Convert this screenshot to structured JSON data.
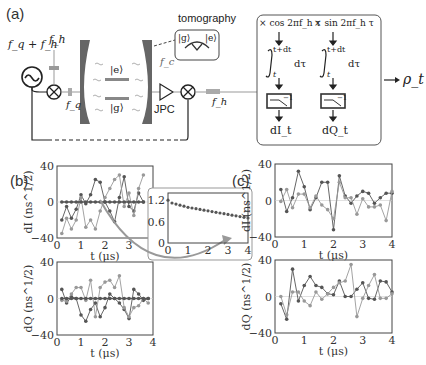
{
  "figure": {
    "panel_labels": {
      "a": "(a)",
      "b": "(b)",
      "c": "(c)"
    },
    "diagram": {
      "source_label": "f_q + f_h",
      "pump_label": "f_h",
      "drive_label": "f_q",
      "state_e": "|e⟩",
      "state_g": "|g⟩",
      "cavity_label": "f_c",
      "amplifier_label": "JPC",
      "output_label": "f_h",
      "tomography_label": "tomography",
      "tomography_states": {
        "g": "|g⟩",
        "e": "|e⟩"
      },
      "demod": {
        "cos_label": "× cos 2πf_h τ",
        "sin_label": "× sin 2πf_h τ",
        "integral_upper": "t+dt",
        "integral_lower": "t",
        "integral_var": "dτ",
        "output_I": "dI_t",
        "output_Q": "dQ_t",
        "filter_label": "−1",
        "result": "ρ_t"
      }
    }
  },
  "chart_data": [
    {
      "id": "b-top",
      "type": "line",
      "panel": "(b)",
      "xlabel": "t (μs)",
      "ylabel": "dI (ns^1/2)",
      "xlim": [
        0,
        4
      ],
      "ylim": [
        -40,
        40
      ],
      "xticks": [
        0,
        1,
        2,
        3,
        4
      ],
      "yticks": [
        -40,
        0,
        40
      ],
      "x": [
        0.2,
        0.4,
        0.6,
        0.8,
        1.0,
        1.2,
        1.4,
        1.6,
        1.8,
        2.0,
        2.2,
        2.4,
        2.6,
        2.8,
        3.0,
        3.2,
        3.4,
        3.6
      ],
      "series": [
        {
          "name": "dark",
          "values": [
            -20,
            -5,
            -18,
            -8,
            8,
            -2,
            8,
            25,
            22,
            0,
            -10,
            -22,
            5,
            28,
            -5,
            -10,
            10,
            0
          ]
        },
        {
          "name": "light",
          "values": [
            -35,
            -18,
            -30,
            -20,
            5,
            -28,
            -20,
            -30,
            -10,
            5,
            15,
            25,
            30,
            -5,
            10,
            -15,
            15,
            30
          ]
        },
        {
          "name": "zero",
          "values": [
            0,
            0,
            0,
            0,
            0,
            0,
            0,
            0,
            0,
            0,
            0,
            0,
            0,
            0,
            0,
            0,
            0,
            0
          ]
        }
      ]
    },
    {
      "id": "b-inset",
      "type": "scatter",
      "xlim": [
        0,
        4
      ],
      "ylim": [
        0,
        1.4
      ],
      "xticks": [
        0,
        1,
        2,
        3,
        4
      ],
      "yticks": [
        0,
        0.6,
        1.2
      ],
      "x": [
        0.0,
        0.2,
        0.4,
        0.6,
        0.8,
        1.0,
        1.2,
        1.4,
        1.6,
        1.8,
        2.0,
        2.2,
        2.4,
        2.6,
        2.8,
        3.0,
        3.2,
        3.4,
        3.6,
        3.8,
        4.0
      ],
      "values": [
        1.2,
        1.12,
        1.09,
        1.06,
        1.03,
        1.0,
        0.98,
        0.96,
        0.94,
        0.92,
        0.9,
        0.88,
        0.86,
        0.84,
        0.82,
        0.8,
        0.78,
        0.76,
        0.74,
        0.72,
        0.7
      ]
    },
    {
      "id": "b-bottom",
      "type": "line",
      "panel": "(b)",
      "xlabel": "t (μs)",
      "ylabel": "dQ (ns^1/2)",
      "xlim": [
        0,
        4
      ],
      "ylim": [
        -40,
        40
      ],
      "xticks": [
        0,
        1,
        2,
        3,
        4
      ],
      "yticks": [
        -40,
        0,
        40
      ],
      "x": [
        0.2,
        0.4,
        0.6,
        0.8,
        1.0,
        1.2,
        1.4,
        1.6,
        1.8,
        2.0,
        2.2,
        2.4,
        2.6,
        2.8,
        3.0,
        3.2,
        3.4,
        3.6,
        3.8
      ],
      "series": [
        {
          "name": "dark",
          "values": [
            10,
            -5,
            2,
            0,
            -18,
            -25,
            -12,
            -5,
            -20,
            -10,
            5,
            0,
            -5,
            -12,
            -22,
            10,
            5,
            -2,
            0
          ]
        },
        {
          "name": "light",
          "values": [
            -2,
            -3,
            5,
            12,
            12,
            -2,
            20,
            -20,
            12,
            18,
            20,
            12,
            25,
            -10,
            -20,
            -10,
            -8,
            0,
            -5
          ]
        },
        {
          "name": "zero",
          "values": [
            0,
            0,
            0,
            0,
            0,
            0,
            0,
            0,
            0,
            0,
            0,
            0,
            0,
            0,
            0,
            0,
            0,
            0,
            0
          ]
        }
      ]
    },
    {
      "id": "c-top",
      "type": "line",
      "panel": "(c)",
      "xlabel": "t (μs)",
      "ylabel": "dI (ns^1/2)",
      "xlim": [
        0,
        4
      ],
      "ylim": [
        -40,
        40
      ],
      "xticks": [
        0,
        1,
        2,
        3,
        4
      ],
      "yticks": [
        -40,
        0,
        40
      ],
      "x": [
        0.2,
        0.4,
        0.6,
        0.8,
        1.0,
        1.2,
        1.4,
        1.6,
        1.8,
        2.0,
        2.2,
        2.4,
        2.6,
        2.8,
        3.0,
        3.2,
        3.4,
        3.6,
        3.8,
        4.0
      ],
      "series": [
        {
          "name": "dark",
          "values": [
            12,
            -12,
            3,
            32,
            15,
            -10,
            3,
            20,
            20,
            -32,
            27,
            5,
            -3,
            5,
            10,
            8,
            -3,
            3,
            8,
            8
          ]
        },
        {
          "name": "light",
          "values": [
            -1,
            12,
            -8,
            7,
            7,
            -8,
            5,
            -5,
            -10,
            -20,
            20,
            3,
            3,
            -15,
            2,
            -7,
            -7,
            -5,
            -22,
            10
          ]
        }
      ]
    },
    {
      "id": "c-bottom",
      "type": "line",
      "panel": "(c)",
      "xlabel": "t (μs)",
      "ylabel": "dQ (ns^1/2)",
      "xlim": [
        0,
        4
      ],
      "ylim": [
        -40,
        40
      ],
      "xticks": [
        0,
        1,
        2,
        3,
        4
      ],
      "yticks": [
        -40,
        0,
        40
      ],
      "x": [
        0.2,
        0.4,
        0.6,
        0.8,
        1.0,
        1.2,
        1.4,
        1.6,
        1.8,
        2.0,
        2.2,
        2.4,
        2.6,
        2.8,
        3.0,
        3.2,
        3.4,
        3.6,
        3.8,
        4.0
      ],
      "series": [
        {
          "name": "dark",
          "values": [
            -8,
            -25,
            30,
            -5,
            12,
            22,
            12,
            10,
            3,
            2,
            17,
            0,
            0,
            8,
            15,
            -2,
            -3,
            17,
            16,
            5
          ]
        },
        {
          "name": "light",
          "values": [
            0,
            -20,
            5,
            5,
            -5,
            -10,
            5,
            -3,
            3,
            10,
            15,
            17,
            35,
            -22,
            -2,
            12,
            24,
            -2,
            -2,
            3
          ]
        }
      ]
    }
  ]
}
